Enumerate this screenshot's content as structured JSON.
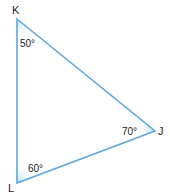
{
  "diagram": {
    "type": "triangle",
    "stroke_color": "#5ea9dc",
    "fill_color": "#d6ebf8",
    "vertices": [
      {
        "name": "K",
        "angle_label": "50°"
      },
      {
        "name": "J",
        "angle_label": "70°"
      },
      {
        "name": "L",
        "angle_label": "60°"
      }
    ]
  }
}
